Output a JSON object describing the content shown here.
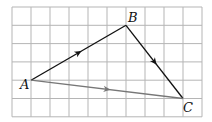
{
  "grid": {
    "cols": 10,
    "rows": 6,
    "left": 12,
    "top": 7,
    "cell_w": 19,
    "cell_h": 18.3,
    "line_color": "#b5b5b5"
  },
  "points": [
    {
      "id": "A",
      "label": "A",
      "col": 1,
      "row": 4
    },
    {
      "id": "B",
      "label": "B",
      "col": 6,
      "row": 1
    },
    {
      "id": "C",
      "label": "C",
      "col": 9,
      "row": 5
    }
  ],
  "vectors": [
    {
      "from": "A",
      "to": "B",
      "color": "#111111"
    },
    {
      "from": "B",
      "to": "C",
      "color": "#111111"
    },
    {
      "from": "A",
      "to": "C",
      "color": "#777777"
    }
  ],
  "labels": {
    "A": "A",
    "B": "B",
    "C": "C"
  }
}
